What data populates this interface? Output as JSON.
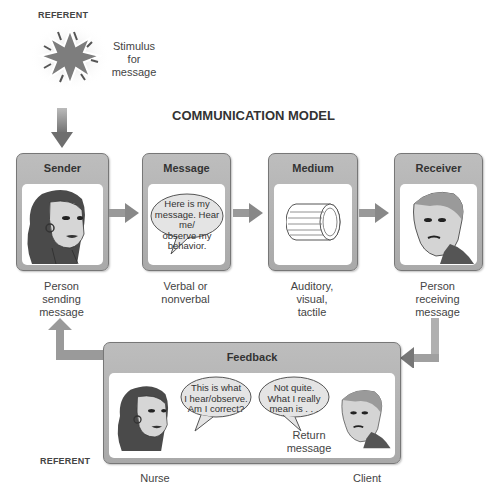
{
  "title": "COMMUNICATION MODEL",
  "referent_top": {
    "label": "REFERENT",
    "stimulus": [
      "Stimulus",
      "for",
      "message"
    ]
  },
  "boxes": [
    {
      "name": "sender",
      "header": "Sender",
      "caption": [
        "Person",
        "sending",
        "message"
      ]
    },
    {
      "name": "message",
      "header": "Message",
      "caption": [
        "Verbal or",
        "nonverbal"
      ],
      "bubble": [
        "Here is my",
        "message. Hear me/",
        "observe my",
        "behavior."
      ]
    },
    {
      "name": "medium",
      "header": "Medium",
      "caption": [
        "Auditory,",
        "visual,",
        "tactile"
      ]
    },
    {
      "name": "receiver",
      "header": "Receiver",
      "caption": [
        "Person",
        "receiving",
        "message"
      ]
    }
  ],
  "feedback": {
    "header": "Feedback",
    "nurse_bubble": [
      "This is what",
      "I hear/observe.",
      "Am I correct?"
    ],
    "client_bubble": [
      "Not quite.",
      "What I really",
      "mean is . . ."
    ],
    "return_label": [
      "Return",
      "message"
    ],
    "nurse_label": "Nurse",
    "client_label": "Client"
  },
  "referent_bottom": {
    "label": "REFERENT"
  },
  "colors": {
    "box_header": "#b3b3b3",
    "arrow": "#8a8a8a",
    "border": "#777777"
  }
}
